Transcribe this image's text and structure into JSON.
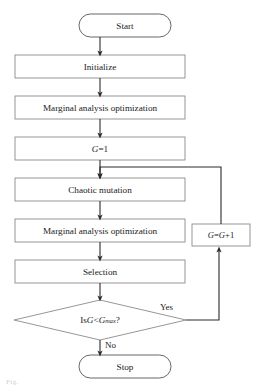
{
  "diagram": {
    "stroke_color": "#3f3f3f",
    "arrow_color": "#2b2b2b",
    "fill_color": "#ffffff",
    "background_color": "#ffffff",
    "width": 260,
    "height": 392
  },
  "nodes": {
    "start": {
      "label": "Start",
      "shape": "terminator"
    },
    "initialize": {
      "label": "Initialize",
      "shape": "process"
    },
    "marginal_1": {
      "label": "Marginal analysis optimization",
      "shape": "process"
    },
    "g_init": {
      "label": "G =1",
      "label_var": "G",
      "label_rest": " =1",
      "shape": "process"
    },
    "chaotic": {
      "label": "Chaotic mutation",
      "shape": "process"
    },
    "marginal_2": {
      "label": "Marginal analysis optimization",
      "shape": "process"
    },
    "selection": {
      "label": "Selection",
      "shape": "process"
    },
    "decision": {
      "label": "Is G < Gmax ?",
      "prefix": "Is ",
      "var1": "G",
      "operator": " < ",
      "var2": "G",
      "subscript": "max",
      "suffix": " ?",
      "shape": "decision"
    },
    "increment": {
      "label": "G = G +1",
      "var1": "G",
      "mid": " = ",
      "var2": "G",
      "suffix": " +1",
      "shape": "process"
    },
    "stop": {
      "label": "Stop",
      "shape": "terminator"
    }
  },
  "edges": {
    "yes_label": "Yes",
    "no_label": "No"
  },
  "caption": {
    "text": "Fig."
  }
}
